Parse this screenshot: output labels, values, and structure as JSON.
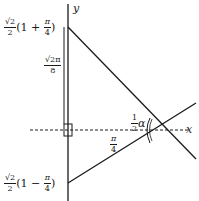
{
  "diagram": {
    "axes": {
      "y_label": "y",
      "x_label": "x"
    },
    "labels": {
      "top_vertex": {
        "coef_num": "√2",
        "coef_den": "2",
        "paren_open": "(1 + ",
        "frac_num": "π",
        "frac_den": "4",
        "paren_close": ")"
      },
      "bottom_vertex": {
        "coef_num": "√2",
        "coef_den": "2",
        "paren_open": "(1 − ",
        "frac_num": "π",
        "frac_den": "4",
        "paren_close": ")"
      },
      "segment_length": {
        "num": "√2π",
        "den": "8"
      },
      "horizontal_distance": {
        "num": "π",
        "den": "4"
      },
      "angle": {
        "coef_num": "1",
        "coef_den": "2",
        "symbol": "α"
      }
    },
    "colors": {
      "line": "#1a1a1a",
      "background": "#ffffff"
    }
  }
}
